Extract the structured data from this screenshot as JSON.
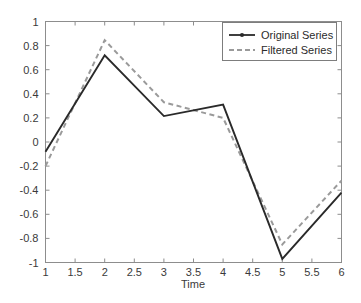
{
  "chart_data": {
    "type": "line",
    "title": "",
    "xlabel": "Time",
    "ylabel": "",
    "xlim": [
      1,
      6
    ],
    "ylim": [
      -1,
      1
    ],
    "grid": false,
    "legend_position": "top-right",
    "x": [
      1,
      2,
      3,
      4,
      5,
      6
    ],
    "xticks": [
      "1",
      "1.5",
      "2",
      "2.5",
      "3",
      "3.5",
      "4",
      "4.5",
      "5",
      "5.5",
      "6"
    ],
    "xtick_values": [
      1,
      1.5,
      2,
      2.5,
      3,
      3.5,
      4,
      4.5,
      5,
      5.5,
      6
    ],
    "yticks": [
      "1",
      "0.8",
      "0.6",
      "0.4",
      "0.2",
      "0",
      "-0.2",
      "-0.4",
      "-0.6",
      "-0.8",
      "-1"
    ],
    "ytick_values": [
      1,
      0.8,
      0.6,
      0.4,
      0.2,
      0,
      -0.2,
      -0.4,
      -0.6,
      -0.8,
      -1
    ],
    "series": [
      {
        "name": "Original Series",
        "values": [
          -0.08,
          0.72,
          0.215,
          0.31,
          -0.97,
          -0.42
        ],
        "color": "#2a2a2a",
        "style": "solid",
        "marker": "point"
      },
      {
        "name": "Filtered Series",
        "values": [
          -0.2,
          0.845,
          0.33,
          0.2,
          -0.85,
          -0.32
        ],
        "color": "#9a9a9a",
        "style": "dashed",
        "marker": "none"
      }
    ]
  },
  "legend": {
    "entries": [
      {
        "label": "Original Series"
      },
      {
        "label": "Filtered Series"
      }
    ]
  },
  "axes": {
    "x_label": "Time"
  },
  "colors": {
    "original": "#2a2a2a",
    "filtered": "#9a9a9a",
    "frame": "#8d8d8d",
    "background": "#ffffff"
  }
}
